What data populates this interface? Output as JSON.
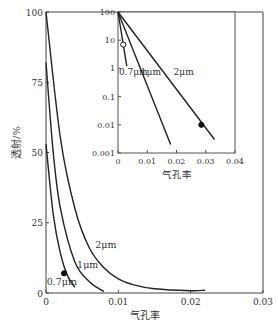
{
  "chart_data": [
    {
      "type": "line",
      "title": "",
      "xlabel": "气孔率",
      "ylabel": "透射/%",
      "xlim": [
        0,
        0.03
      ],
      "ylim": [
        0,
        100
      ],
      "xticks": [
        "0",
        "0.01",
        "0.02",
        "0.03"
      ],
      "yticks": [
        "0",
        "25",
        "50",
        "75",
        "100"
      ],
      "grid": false,
      "series": [
        {
          "name": "0.7μm",
          "x": [
            0,
            0.001,
            0.002,
            0.003,
            0.004
          ],
          "values": [
            53,
            28,
            14,
            6,
            2
          ],
          "end_x": 0.004
        },
        {
          "name": "1μm",
          "x": [
            0,
            0.001,
            0.002,
            0.004,
            0.006,
            0.008
          ],
          "values": [
            82,
            50,
            30,
            11,
            4,
            0.5
          ],
          "end_x": 0.0085
        },
        {
          "name": "2μm",
          "x": [
            0,
            0.002,
            0.004,
            0.006,
            0.008,
            0.01,
            0.012,
            0.015,
            0.02,
            0.022
          ],
          "values": [
            100,
            55,
            30,
            16,
            9,
            5,
            3,
            1.5,
            0.8,
            1
          ],
          "end_x": 0.022
        }
      ],
      "markers": [
        {
          "series": "0.7μm",
          "x": 0.0025,
          "y": 7,
          "style": "filled"
        }
      ],
      "labels": [
        {
          "text": "0.7μm",
          "x": 0.0001,
          "y": 3
        },
        {
          "text": "1μm",
          "x": 0.0043,
          "y": 9
        },
        {
          "text": "2μm",
          "x": 0.0068,
          "y": 16
        }
      ]
    },
    {
      "type": "line",
      "title": "inset (log scale)",
      "xlabel": "气孔率",
      "ylabel": "",
      "xlim": [
        0,
        0.04
      ],
      "ylim": [
        0.001,
        100
      ],
      "yscale": "log",
      "xticks": [
        "0",
        "0.01",
        "0.02",
        "0.03",
        "0.04"
      ],
      "yticks": [
        "0.001",
        "0.01",
        "0.1",
        "1",
        "10",
        "100"
      ],
      "series": [
        {
          "name": "0.7μm",
          "x": [
            0,
            0.003
          ],
          "values": [
            100,
            1.2
          ]
        },
        {
          "name": "1μm",
          "x": [
            0,
            0.018
          ],
          "values": [
            100,
            0.002
          ]
        },
        {
          "name": "2μm",
          "x": [
            0,
            0.033
          ],
          "values": [
            100,
            0.003
          ]
        }
      ],
      "markers": [
        {
          "series": "0.7μm",
          "x": 0.0018,
          "y": 7,
          "style": "open"
        },
        {
          "series": "2μm",
          "x": 0.0285,
          "y": 0.01,
          "style": "filled"
        }
      ],
      "labels": [
        {
          "text": "0.7μm",
          "x": 0.0003,
          "y": 0.6
        },
        {
          "text": "1μm",
          "x": 0.0078,
          "y": 0.6
        },
        {
          "text": "2μm",
          "x": 0.019,
          "y": 0.6
        }
      ]
    }
  ]
}
